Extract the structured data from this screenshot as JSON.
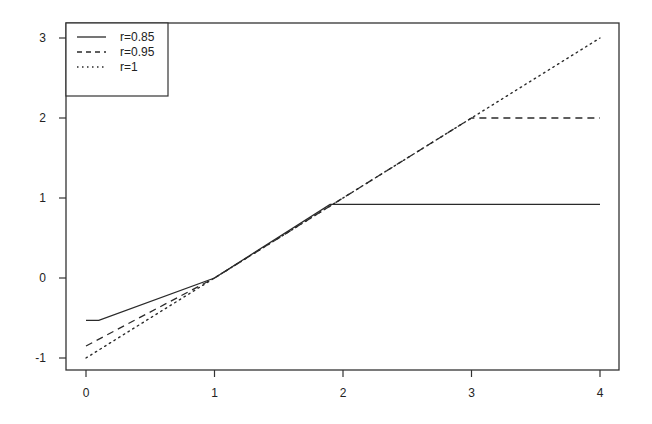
{
  "chart_data": {
    "type": "line",
    "title": "",
    "xlabel": "",
    "ylabel": "",
    "xlim": [
      0,
      4
    ],
    "ylim": [
      -1,
      3
    ],
    "x_ticks": [
      0,
      1,
      2,
      3,
      4
    ],
    "y_ticks": [
      -1,
      0,
      1,
      2,
      3
    ],
    "grid": false,
    "legend_position": "top-left",
    "series": [
      {
        "name": "r=0.85",
        "style": "solid",
        "x": [
          0,
          0.1,
          1,
          1.9,
          4
        ],
        "y": [
          -0.53,
          -0.53,
          0,
          0.92,
          0.92
        ]
      },
      {
        "name": "r=0.95",
        "style": "dashed",
        "x": [
          0,
          1,
          3,
          4
        ],
        "y": [
          -0.85,
          0,
          2.0,
          2.0
        ]
      },
      {
        "name": "r=1",
        "style": "dotted",
        "x": [
          0,
          4
        ],
        "y": [
          -1,
          3
        ]
      }
    ]
  },
  "legend": {
    "items": [
      {
        "label": "r=0.85",
        "style": "solid"
      },
      {
        "label": "r=0.95",
        "style": "dashed"
      },
      {
        "label": "r=1",
        "style": "dotted"
      }
    ]
  },
  "axes": {
    "x_tick_labels": [
      "0",
      "1",
      "2",
      "3",
      "4"
    ],
    "y_tick_labels": [
      "-1",
      "0",
      "1",
      "2",
      "3"
    ]
  },
  "colors": {
    "line": "#2a2a2a",
    "frame": "#333333"
  }
}
